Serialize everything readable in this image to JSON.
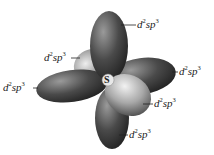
{
  "diagram": {
    "center_atom": "S",
    "labels": [
      {
        "id": "top",
        "base": "d",
        "sup1": "2",
        "mid": "sp",
        "sup2": "3"
      },
      {
        "id": "upper-left",
        "base": "d",
        "sup1": "2",
        "mid": "sp",
        "sup2": "3"
      },
      {
        "id": "left",
        "base": "d",
        "sup1": "2",
        "mid": "sp",
        "sup2": "3"
      },
      {
        "id": "right",
        "base": "d",
        "sup1": "2",
        "mid": "sp",
        "sup2": "3"
      },
      {
        "id": "lower-right",
        "base": "d",
        "sup1": "2",
        "mid": "sp",
        "sup2": "3"
      },
      {
        "id": "bottom",
        "base": "d",
        "sup1": "2",
        "mid": "sp",
        "sup2": "3"
      }
    ],
    "colors": {
      "lobe_dark": "#2a2a2a",
      "lobe_mid": "#6a6a6a",
      "lobe_light": "#d8d8d8",
      "leader_line": "#222222"
    }
  }
}
